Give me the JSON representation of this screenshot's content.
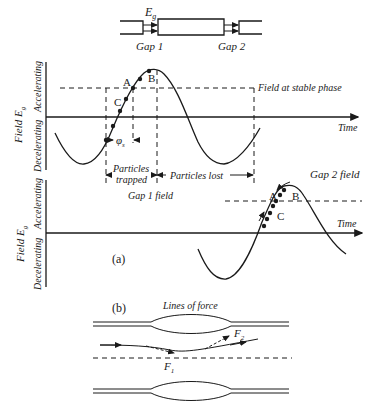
{
  "figure": {
    "top_schematic": {
      "field_label": "E",
      "field_subscript": "g",
      "gap1_label": "Gap 1",
      "gap2_label": "Gap 2"
    },
    "panel_a": {
      "label": "(a)",
      "y_axis_label": "Field E",
      "y_axis_subscript": "g",
      "accelerating_label": "Accelerating",
      "decelerating_label": "Decelerating",
      "time_label": "Time",
      "stable_phase_label": "Field at stable phase",
      "phase_symbol": "φ",
      "phase_subscript": "s",
      "particles_trapped_line1": "Particles",
      "particles_trapped_line2": "trapped",
      "particles_lost_label": "Particles lost",
      "gap1_field_label": "Gap 1 field",
      "gap2_field_label": "Gap 2 field",
      "point_labels": [
        "A",
        "B",
        "C"
      ]
    },
    "panel_b": {
      "label": "(b)",
      "title": "Lines of force",
      "force1_label": "F",
      "force1_subscript": "1",
      "force2_label": "F",
      "force2_subscript": "2"
    }
  }
}
